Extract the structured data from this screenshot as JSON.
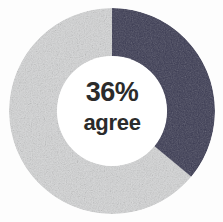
{
  "chart_data": {
    "type": "pie",
    "variant": "donut",
    "title": "",
    "subtitle": "",
    "xlabel": "",
    "ylabel": "",
    "center_label": {
      "value": "36%",
      "caption": "agree"
    },
    "units": "percent",
    "total": 100,
    "start_angle_deg": 0,
    "direction": "clockwise",
    "inner_radius_ratio": 0.53,
    "legend": {
      "visible": false,
      "position": "none",
      "entries": [
        "agree",
        "do not agree"
      ]
    },
    "grid": false,
    "categories": [
      "agree",
      "do not agree"
    ],
    "values": [
      36,
      64
    ],
    "slices": [
      {
        "label": "agree",
        "value": 36,
        "percent": "36%",
        "color": "#3a3a52",
        "start_deg": 0,
        "end_deg": 129.6
      },
      {
        "label": "do not agree",
        "value": 64,
        "percent": "64%",
        "color": "#d4d5d6",
        "start_deg": 129.6,
        "end_deg": 360
      }
    ]
  },
  "colors": {
    "background": "#fdfdfd",
    "hole": "#ffffff",
    "accent_dark": "#3a3a52",
    "accent_light": "#d4d5d6",
    "text": "#2b2b2b"
  }
}
